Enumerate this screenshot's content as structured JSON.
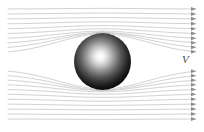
{
  "figure": {
    "background_color": "#ffffff",
    "width": 204,
    "height": 132
  },
  "labels": {
    "velocity": "V"
  },
  "sphere": {
    "center_x": 102.5,
    "center_y": 61.5,
    "radius": 28.5,
    "highlight_x": 100,
    "highlight_y": 58,
    "highlight_color": "#ffffff",
    "mid_color": "#6e6e6e",
    "edge_color": "#0b0b0b"
  },
  "chart_data": {
    "type": "line",
    "xlabel": "",
    "ylabel": "",
    "xlim": [
      0,
      204
    ],
    "ylim": [
      0,
      132
    ],
    "grid": false,
    "legend": "none",
    "annotations": [
      {
        "text": "V",
        "x": 185,
        "y": 62,
        "style": "italic"
      }
    ],
    "stream_color": "#c9c9c9",
    "arrow_color": "#8d8d8d",
    "flow_direction": "left-to-right",
    "obstacle": {
      "shape": "sphere",
      "cx": 102.5,
      "cy": 61.5,
      "r": 28.5
    },
    "series": [
      {
        "name": "streamline-1",
        "y_inlet": 9,
        "y_outlet": 9,
        "deflection": 0.6
      },
      {
        "name": "streamline-2",
        "y_inlet": 14,
        "y_outlet": 14,
        "deflection": 0.9
      },
      {
        "name": "streamline-3",
        "y_inlet": 19,
        "y_outlet": 19,
        "deflection": 1.4
      },
      {
        "name": "streamline-4",
        "y_inlet": 24,
        "y_outlet": 24,
        "deflection": 2.2
      },
      {
        "name": "streamline-5",
        "y_inlet": 29,
        "y_outlet": 29,
        "deflection": 3.4
      },
      {
        "name": "streamline-6",
        "y_inlet": 34,
        "y_outlet": 34,
        "deflection": 5.2
      },
      {
        "name": "streamline-7",
        "y_inlet": 39,
        "y_outlet": 39,
        "deflection": 7.8
      },
      {
        "name": "streamline-8",
        "y_inlet": 44,
        "y_outlet": 44,
        "deflection": 11.5
      },
      {
        "name": "streamline-9",
        "y_inlet": 49,
        "y_outlet": 49,
        "deflection": 16.0
      },
      {
        "name": "streamline-10",
        "y_inlet": 54,
        "y_outlet": 54,
        "deflection": 20.0
      },
      {
        "name": "streamline-11",
        "y_inlet": 69,
        "y_outlet": 69,
        "deflection": -20.0
      },
      {
        "name": "streamline-12",
        "y_inlet": 74,
        "y_outlet": 74,
        "deflection": -16.0
      },
      {
        "name": "streamline-13",
        "y_inlet": 79,
        "y_outlet": 79,
        "deflection": -11.5
      },
      {
        "name": "streamline-14",
        "y_inlet": 84,
        "y_outlet": 84,
        "deflection": -7.8
      },
      {
        "name": "streamline-15",
        "y_inlet": 89,
        "y_outlet": 89,
        "deflection": -5.2
      },
      {
        "name": "streamline-16",
        "y_inlet": 94,
        "y_outlet": 94,
        "deflection": -3.4
      },
      {
        "name": "streamline-17",
        "y_inlet": 99,
        "y_outlet": 99,
        "deflection": -2.2
      },
      {
        "name": "streamline-18",
        "y_inlet": 104,
        "y_outlet": 104,
        "deflection": -1.4
      },
      {
        "name": "streamline-19",
        "y_inlet": 109,
        "y_outlet": 109,
        "deflection": -0.9
      },
      {
        "name": "streamline-20",
        "y_inlet": 114,
        "y_outlet": 114,
        "deflection": -0.6
      },
      {
        "name": "streamline-21",
        "y_inlet": 119,
        "y_outlet": 119,
        "deflection": -0.4
      }
    ],
    "x_start": 8,
    "x_end": 196
  }
}
